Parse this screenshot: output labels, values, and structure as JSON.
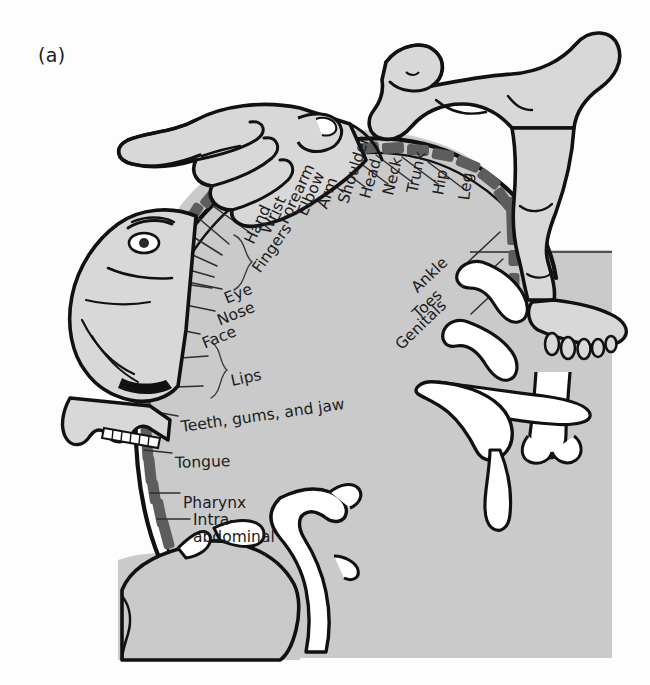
{
  "figure": {
    "panel_letter": "(a)",
    "kind": "sensory-homunculus-somatotopic-map",
    "colors": {
      "background": "#fdfdfd",
      "cortex_field": "#cacaca",
      "strip_segment": "#5d5d5d",
      "outline": "#111111",
      "body_fill": "#d8d8d8",
      "sulcus_white": "#ffffff",
      "leader_line": "#333333",
      "text": "#1c1c1c"
    }
  },
  "labels": {
    "medial_lateral": [
      {
        "id": "hand",
        "text": "Hand"
      },
      {
        "id": "wrist",
        "text": "Wrist"
      },
      {
        "id": "forearm",
        "text": "Forearm"
      },
      {
        "id": "elbow",
        "text": "Elbow"
      },
      {
        "id": "arm",
        "text": "Arm"
      },
      {
        "id": "shoulder",
        "text": "Shoulder"
      },
      {
        "id": "head",
        "text": "Head"
      },
      {
        "id": "neck",
        "text": "Neck"
      },
      {
        "id": "trunk",
        "text": "Trunk"
      },
      {
        "id": "hip",
        "text": "Hip"
      },
      {
        "id": "leg",
        "text": "Leg"
      }
    ],
    "medial_surface": [
      {
        "id": "ankle",
        "text": "Ankle"
      },
      {
        "id": "toes",
        "text": "Toes"
      },
      {
        "id": "genitals",
        "text": "Genitals"
      }
    ],
    "bracketed": [
      {
        "id": "fingers",
        "text": "Fingers"
      },
      {
        "id": "lips",
        "text": "Lips"
      }
    ],
    "face_group": [
      {
        "id": "eye",
        "text": "Eye"
      },
      {
        "id": "nose",
        "text": "Nose"
      },
      {
        "id": "face",
        "text": "Face"
      }
    ],
    "ventral": [
      {
        "id": "teeth",
        "text": "Teeth, gums, and jaw"
      },
      {
        "id": "tongue",
        "text": "Tongue"
      },
      {
        "id": "pharynx",
        "text": "Pharynx"
      }
    ],
    "intra_abdominal": {
      "id": "intra-abdominal",
      "line1": "Intra-",
      "line2": "abdominal"
    }
  }
}
